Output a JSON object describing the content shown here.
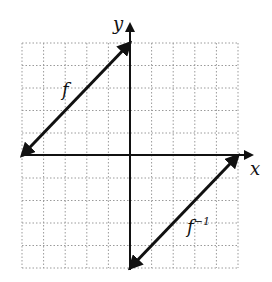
{
  "chart_data": {
    "type": "line",
    "title": "",
    "xlabel": "x",
    "ylabel": "y",
    "xlim": [
      -5,
      5
    ],
    "ylim": [
      -5,
      5
    ],
    "grid": true,
    "grid_style": "dotted",
    "tick_labels": false,
    "series": [
      {
        "name": "f",
        "x": [
          -5,
          0
        ],
        "y": [
          0,
          5
        ],
        "arrows": "both"
      },
      {
        "name": "f^-1",
        "x": [
          0,
          5
        ],
        "y": [
          -5,
          0
        ],
        "arrows": "both"
      }
    ],
    "annotations": [
      {
        "text": "f",
        "near": "f line, upper-left quadrant"
      },
      {
        "text": "f⁻¹",
        "near": "f inverse line, lower-right quadrant"
      }
    ]
  },
  "labels": {
    "x_axis": "x",
    "y_axis": "y",
    "f": "f",
    "f_inv_base": "f",
    "f_inv_sup": "−1"
  },
  "colors": {
    "line": "#111111",
    "grid": "#9a9a9a",
    "background": "#ffffff"
  }
}
